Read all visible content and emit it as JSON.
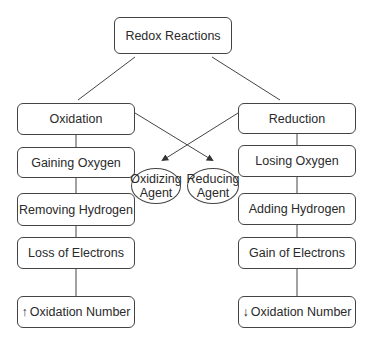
{
  "title": "Redox Reactions",
  "left_column": {
    "header": "Oxidation",
    "items": [
      "Gaining Oxygen",
      "Removing Hydrogen",
      "Loss of Electrons"
    ],
    "oxidation_number": {
      "arrow": "↑",
      "label": "Oxidation Number"
    }
  },
  "right_column": {
    "header": "Reduction",
    "items": [
      "Losing Oxygen",
      "Adding Hydrogen",
      "Gain of Electrons"
    ],
    "oxidation_number": {
      "arrow": "↓",
      "label": "Oxidation Number"
    }
  },
  "agents": {
    "oxidizing": {
      "line1": "Oxidizing",
      "line2": "Agent"
    },
    "reducing": {
      "line1": "Reducing",
      "line2": "Agent"
    }
  },
  "colors": {
    "stroke": "#444444",
    "text": "#2a2a2a",
    "background": "#ffffff"
  }
}
